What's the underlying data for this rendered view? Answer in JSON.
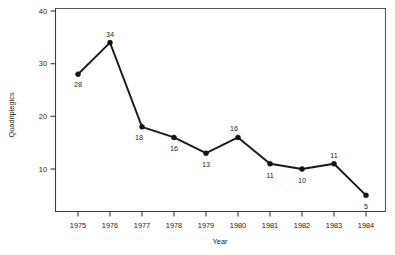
{
  "chart_data": {
    "type": "line",
    "title": "",
    "xlabel": "Year",
    "ylabel": "Quadriplegics",
    "categories": [
      "1975",
      "1976",
      "1977",
      "1978",
      "1979",
      "1980",
      "1981",
      "1982",
      "1983",
      "1984"
    ],
    "values": [
      28,
      34,
      18,
      16,
      13,
      16,
      11,
      10,
      11,
      5
    ],
    "point_labels": [
      "28",
      "34",
      "18",
      "16",
      "13",
      "16",
      "11",
      "10",
      "11",
      "5"
    ],
    "series": [
      {
        "name": "Quadriplegics",
        "values": [
          28,
          34,
          18,
          16,
          13,
          16,
          11,
          10,
          11,
          5
        ]
      }
    ],
    "xlim": [
      1974.5,
      1984.6
    ],
    "ylim": [
      2,
      40
    ],
    "yticks": [
      10,
      20,
      30,
      40
    ],
    "ytick_labels": [
      "10",
      "20",
      "30",
      "40"
    ],
    "xticks": [
      1975,
      1976,
      1977,
      1978,
      1979,
      1980,
      1981,
      1982,
      1983,
      1984
    ],
    "grid": false,
    "legend": false,
    "legend_position": "none",
    "marker": "filled-circle",
    "line_color": "#1a1a1a",
    "marker_color": "#141414",
    "axis_color": "#3d3d3d",
    "background_color": "#ffffff",
    "label_offsets": [
      {
        "dx": 0,
        "dy": 13
      },
      {
        "dx": 0,
        "dy": -6
      },
      {
        "dx": -3,
        "dy": 13
      },
      {
        "dx": 0,
        "dy": 14
      },
      {
        "dx": 0,
        "dy": 14
      },
      {
        "dx": -4,
        "dy": -6
      },
      {
        "dx": 0,
        "dy": 14
      },
      {
        "dx": 0,
        "dy": 14
      },
      {
        "dx": 0,
        "dy": -6
      },
      {
        "dx": 0,
        "dy": 14
      }
    ]
  }
}
